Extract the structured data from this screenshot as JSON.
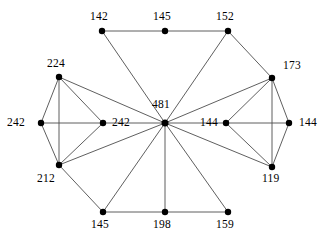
{
  "figure": {
    "type": "node-link-graph",
    "background_color": "#ffffff",
    "edge_color": "#4d4d4d",
    "node_color": "#000000",
    "label_color": "#000000",
    "node_radius": 3.2,
    "edge_width": 0.9,
    "width": 333,
    "height": 246
  },
  "chart_data": {
    "type": "diagram",
    "subtype": "wheel-graph",
    "title": "",
    "node_count": 13,
    "edge_count": 24,
    "nodes": [
      {
        "id": "hub",
        "label": "481",
        "x": 165,
        "y": 123,
        "label_x": 152,
        "label_y": 99,
        "role": "hub"
      },
      {
        "id": "n142",
        "label": "142",
        "x": 102,
        "y": 31,
        "label_x": 90,
        "label_y": 11,
        "role": "rim"
      },
      {
        "id": "n145top",
        "label": "145",
        "x": 165,
        "y": 31,
        "label_x": 153,
        "label_y": 11,
        "role": "rim"
      },
      {
        "id": "n152",
        "label": "152",
        "x": 228,
        "y": 31,
        "label_x": 216,
        "label_y": 11,
        "role": "rim"
      },
      {
        "id": "n173",
        "label": "173",
        "x": 272,
        "y": 78,
        "label_x": 283,
        "label_y": 60,
        "role": "rim"
      },
      {
        "id": "n144in",
        "label": "144",
        "x": 226,
        "y": 123,
        "label_x": 200,
        "label_y": 117,
        "role": "rim"
      },
      {
        "id": "n144out",
        "label": "144",
        "x": 289,
        "y": 123,
        "label_x": 299,
        "label_y": 117,
        "role": "rim"
      },
      {
        "id": "n119",
        "label": "119",
        "x": 272,
        "y": 167,
        "label_x": 262,
        "label_y": 173,
        "role": "rim"
      },
      {
        "id": "n159",
        "label": "159",
        "x": 228,
        "y": 212,
        "label_x": 216,
        "label_y": 219,
        "role": "rim"
      },
      {
        "id": "n198",
        "label": "198",
        "x": 165,
        "y": 212,
        "label_x": 153,
        "label_y": 219,
        "role": "rim"
      },
      {
        "id": "n145bot",
        "label": "145",
        "x": 103,
        "y": 212,
        "label_x": 91,
        "label_y": 219,
        "role": "rim"
      },
      {
        "id": "n212",
        "label": "212",
        "x": 59,
        "y": 165,
        "label_x": 37,
        "label_y": 173,
        "role": "rim"
      },
      {
        "id": "n242in",
        "label": "242",
        "x": 103,
        "y": 123,
        "label_x": 112,
        "label_y": 117,
        "role": "rim"
      },
      {
        "id": "n242out",
        "label": "242",
        "x": 41,
        "y": 123,
        "label_x": 7,
        "label_y": 117,
        "role": "rim"
      },
      {
        "id": "n224",
        "label": "224",
        "x": 59,
        "y": 77,
        "label_x": 47,
        "label_y": 58,
        "role": "rim"
      }
    ],
    "edges": [
      {
        "source": "hub",
        "target": "n142"
      },
      {
        "source": "hub",
        "target": "n152"
      },
      {
        "source": "hub",
        "target": "n173"
      },
      {
        "source": "hub",
        "target": "n144in"
      },
      {
        "source": "hub",
        "target": "n119"
      },
      {
        "source": "hub",
        "target": "n159"
      },
      {
        "source": "hub",
        "target": "n198"
      },
      {
        "source": "hub",
        "target": "n145bot"
      },
      {
        "source": "hub",
        "target": "n212"
      },
      {
        "source": "hub",
        "target": "n242in"
      },
      {
        "source": "hub",
        "target": "n224"
      },
      {
        "source": "n142",
        "target": "n145top"
      },
      {
        "source": "n145top",
        "target": "n152"
      },
      {
        "source": "n152",
        "target": "n173"
      },
      {
        "source": "n173",
        "target": "n144in"
      },
      {
        "source": "n173",
        "target": "n144out"
      },
      {
        "source": "n173",
        "target": "n119"
      },
      {
        "source": "n144in",
        "target": "n144out"
      },
      {
        "source": "n144in",
        "target": "n119"
      },
      {
        "source": "n144out",
        "target": "n119"
      },
      {
        "source": "n159",
        "target": "n198"
      },
      {
        "source": "n198",
        "target": "n145bot"
      },
      {
        "source": "n145bot",
        "target": "n212"
      },
      {
        "source": "n212",
        "target": "n242out"
      },
      {
        "source": "n212",
        "target": "n242in"
      },
      {
        "source": "n212",
        "target": "n224"
      },
      {
        "source": "n242out",
        "target": "n242in"
      },
      {
        "source": "n242out",
        "target": "n224"
      },
      {
        "source": "n224",
        "target": "n242in"
      }
    ]
  }
}
